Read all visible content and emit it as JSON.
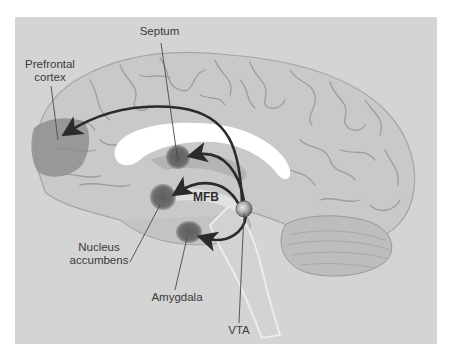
{
  "figure": {
    "type": "neuroanatomy-diagram",
    "colors": {
      "background": "#d4d4d4",
      "brain_fill": "#c8c8c8",
      "sulci": "#9c9c9c",
      "corpus_callosum": "#ffffff",
      "target_region": "#6e6e6e",
      "prefrontal_region": "#8e8e8e",
      "arrow": "#2b2b2b",
      "vta_node": "#9a9a9a",
      "label_text": "#3a3a3a"
    }
  },
  "labels": {
    "septum": "Septum",
    "prefrontal_line1": "Prefrontal",
    "prefrontal_line2": "cortex",
    "mfb": "MFB",
    "nucleus_line1": "Nucleus",
    "nucleus_line2": "accumbens",
    "amygdala": "Amygdala",
    "vta": "VTA"
  },
  "structures": [
    {
      "name": "Prefrontal cortex",
      "role": "projection target"
    },
    {
      "name": "Septum",
      "role": "projection target"
    },
    {
      "name": "Nucleus accumbens",
      "role": "projection target"
    },
    {
      "name": "Amygdala",
      "role": "projection target"
    },
    {
      "name": "VTA",
      "role": "projection source"
    },
    {
      "name": "MFB",
      "role": "fiber bundle (medial forebrain bundle)"
    }
  ],
  "projections": [
    {
      "from": "VTA",
      "to": "Prefrontal cortex"
    },
    {
      "from": "VTA",
      "to": "Septum"
    },
    {
      "from": "VTA",
      "to": "Nucleus accumbens"
    },
    {
      "from": "VTA",
      "to": "Amygdala"
    }
  ]
}
